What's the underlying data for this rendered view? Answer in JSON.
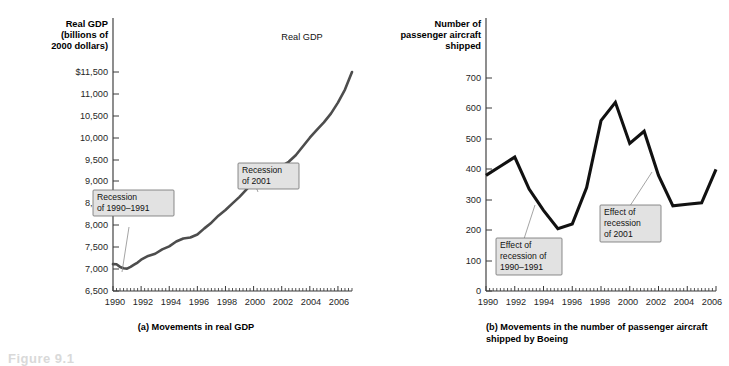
{
  "figure": {
    "figure_label": "Figure 9.1",
    "panels": [
      "(a) Movements in real GDP",
      "(b) Movements in the number of passenger aircraft shipped by Boeing"
    ]
  },
  "panel_a": {
    "caption": "(a) Movements in real GDP",
    "axis_title_lines": [
      "Real GDP",
      "(billions of",
      "2000 dollars)"
    ],
    "series_label": "Real GDP",
    "y_ticklabels": [
      "$11,500",
      "11,000",
      "10,500",
      "10,000",
      "9,500",
      "9,000",
      "8,500",
      "8,000",
      "7,500",
      "7,000",
      "6,500"
    ],
    "x_ticklabels": [
      "1990",
      "1992",
      "1994",
      "1996",
      "1998",
      "2000",
      "2002",
      "2004",
      "2006"
    ],
    "callouts": [
      {
        "name": "recession-1990-1991",
        "lines": [
          "Recession",
          "of 1990–1991"
        ]
      },
      {
        "name": "recession-2001",
        "lines": [
          "Recession",
          "of 2001"
        ]
      }
    ]
  },
  "panel_b": {
    "caption_lines": [
      "(b) Movements in the number of passenger aircraft",
      "shipped by Boeing"
    ],
    "axis_title_lines": [
      "Number of",
      "passenger aircraft",
      "shipped"
    ],
    "y_ticklabels": [
      "700",
      "600",
      "500",
      "400",
      "300",
      "200",
      "100",
      "0"
    ],
    "x_ticklabels": [
      "1990",
      "1992",
      "1994",
      "1996",
      "1998",
      "2000",
      "2002",
      "2004",
      "2006"
    ],
    "callouts": [
      {
        "name": "effect-recession-1990-1991",
        "lines": [
          "Effect of",
          "recession of",
          "1990–1991"
        ]
      },
      {
        "name": "effect-recession-2001",
        "lines": [
          "Effect of",
          "recession",
          "of 2001"
        ]
      }
    ]
  },
  "colors": {
    "line_a": "#4d4d4d",
    "line_b": "#111111",
    "axis": "#3a3a3a",
    "callout_fill": "#e2e2e2",
    "callout_stroke": "#6e6e6e",
    "leader": "#8d8d8d",
    "background": "#ffffff"
  },
  "chart_data": [
    {
      "type": "line",
      "id": "panel-a-real-gdp",
      "title": "(a) Movements in real GDP",
      "xlabel": "",
      "ylabel": "Real GDP (billions of 2000 dollars)",
      "series_label": "Real GDP",
      "xlim": [
        1990,
        2007
      ],
      "ylim": [
        6500,
        11500
      ],
      "ytick_values": [
        6500,
        7000,
        7500,
        8000,
        8500,
        9000,
        9500,
        10000,
        10500,
        11000,
        11500
      ],
      "xtick_values": [
        1990,
        1992,
        1994,
        1996,
        1998,
        2000,
        2002,
        2004,
        2006
      ],
      "minor_xticks": "quarterly",
      "grid": false,
      "legend": "inline-label",
      "x": [
        1990.0,
        1990.25,
        1990.5,
        1990.75,
        1991.0,
        1991.25,
        1991.5,
        1991.75,
        1992.0,
        1992.5,
        1993.0,
        1993.5,
        1994.0,
        1994.5,
        1995.0,
        1995.5,
        1996.0,
        1996.5,
        1997.0,
        1997.5,
        1998.0,
        1998.5,
        1999.0,
        1999.5,
        2000.0,
        2000.5,
        2000.75,
        2001.0,
        2001.5,
        2002.0,
        2002.5,
        2003.0,
        2003.5,
        2004.0,
        2004.5,
        2005.0,
        2005.5,
        2006.0,
        2006.5,
        2007.0
      ],
      "y": [
        7113,
        7110,
        7050,
        7020,
        7010,
        7050,
        7100,
        7150,
        7215,
        7300,
        7350,
        7450,
        7520,
        7630,
        7700,
        7720,
        7790,
        7930,
        8060,
        8220,
        8350,
        8500,
        8650,
        8820,
        9000,
        9180,
        9220,
        9230,
        9260,
        9350,
        9450,
        9600,
        9800,
        10000,
        10180,
        10350,
        10550,
        10800,
        11100,
        11500
      ],
      "annotations": [
        {
          "label": "Recession of 1990–1991",
          "points_at": [
            1991.05,
            7020
          ]
        },
        {
          "label": "Recession of 2001",
          "points_at": [
            2001.1,
            9235
          ]
        }
      ]
    },
    {
      "type": "line",
      "id": "panel-b-boeing-aircraft",
      "title": "(b) Movements in the number of passenger aircraft shipped by Boeing",
      "xlabel": "",
      "ylabel": "Number of passenger aircraft shipped",
      "xlim": [
        1990,
        2006
      ],
      "ylim": [
        0,
        750
      ],
      "ytick_values": [
        0,
        100,
        200,
        300,
        400,
        500,
        600,
        700
      ],
      "xtick_values": [
        1990,
        1992,
        1994,
        1996,
        1998,
        2000,
        2002,
        2004,
        2006
      ],
      "minor_xticks": "quarterly",
      "grid": false,
      "categories": [
        1990,
        1991,
        1992,
        1993,
        1994,
        1995,
        1996,
        1997,
        1998,
        1999,
        2000,
        2001,
        2002,
        2003,
        2004,
        2005,
        2006
      ],
      "values": [
        380,
        410,
        440,
        335,
        265,
        205,
        220,
        340,
        560,
        620,
        485,
        525,
        380,
        280,
        285,
        290,
        400
      ],
      "annotations": [
        {
          "label": "Effect of recession of 1990–1991",
          "points_at": [
            1993.4,
            300
          ]
        },
        {
          "label": "Effect of recession of 2001",
          "points_at": [
            2001.75,
            440
          ]
        }
      ]
    }
  ]
}
